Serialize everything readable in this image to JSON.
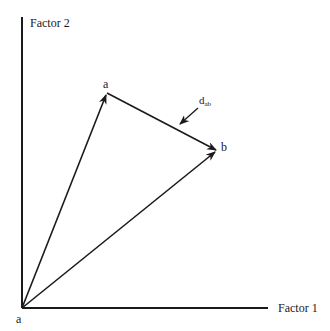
{
  "diagram": {
    "type": "vector-distance-diagram",
    "axes": {
      "y_label": "Factor 2",
      "x_label": "Factor 1"
    },
    "origin_label": "a",
    "points": [
      {
        "id": "a",
        "label": "a",
        "x": 107,
        "y": 93
      },
      {
        "id": "b",
        "label": "b",
        "x": 217,
        "y": 151
      }
    ],
    "vectors": [
      {
        "from": "origin",
        "to": "a"
      },
      {
        "from": "origin",
        "to": "b"
      },
      {
        "from": "a",
        "to": "b"
      }
    ],
    "distance_label": {
      "main": "d",
      "subscript": "ab"
    },
    "colors": {
      "ink": "#1a1a1a",
      "background": "#ffffff"
    }
  }
}
